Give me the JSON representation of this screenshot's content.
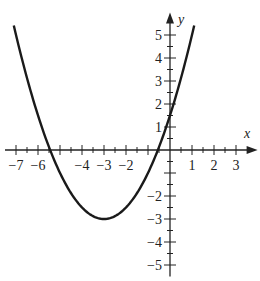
{
  "chart_data": {
    "type": "line",
    "title": "",
    "xlabel": "x",
    "ylabel": "y",
    "xlim": [
      -7.5,
      3.8
    ],
    "ylim": [
      -5.5,
      5.8
    ],
    "grid": false,
    "function": "f(x) = 0.5(x + 3)^2 - 3",
    "vertex": [
      -3,
      -3
    ],
    "x_intercepts": [
      -5.45,
      -0.55
    ],
    "y_intercept": 1.5,
    "x_ticks_labeled": [
      -7,
      -6,
      -4,
      -3,
      -2,
      1,
      2,
      3
    ],
    "y_ticks_labeled": [
      5,
      4,
      3,
      2,
      1,
      -2,
      -3,
      -4,
      -5
    ],
    "minor_tick_step": 0.5,
    "series": [
      {
        "name": "parabola",
        "x": [
          -7.1,
          -6.5,
          -6,
          -5.5,
          -5,
          -4.5,
          -4,
          -3.5,
          -3,
          -2.5,
          -2,
          -1.5,
          -1,
          -0.5,
          0,
          0.5,
          1.1
        ],
        "y": [
          5.41,
          3.13,
          1.5,
          0.13,
          -1.0,
          -1.88,
          -2.5,
          -2.88,
          -3.0,
          -2.88,
          -2.5,
          -1.88,
          -1.0,
          0.13,
          1.5,
          3.13,
          5.41
        ]
      }
    ]
  },
  "labels": {
    "x_axis": "x",
    "y_axis": "y",
    "x_ticks": [
      "−7",
      "−6",
      "−4",
      "−3",
      "−2",
      "1",
      "2",
      "3"
    ],
    "y_ticks": [
      "5",
      "4",
      "3",
      "2",
      "1",
      "−2",
      "−3",
      "−4",
      "−5"
    ]
  },
  "colors": {
    "curve": "#1a1a1a",
    "axis": "#222222"
  }
}
